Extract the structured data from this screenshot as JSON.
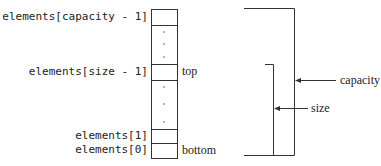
{
  "diagram": {
    "index_labels": {
      "capacity_minus_1": "elements[capacity - 1]",
      "size_minus_1": "elements[size - 1]",
      "one": "elements[1]",
      "zero": "elements[0]"
    },
    "cell_labels": {
      "top": "top",
      "bottom": "bottom"
    },
    "brackets": {
      "capacity": "capacity",
      "size": "size"
    },
    "ellipsis": "⋮",
    "colors": {
      "line": "#333333",
      "text": "#222222"
    }
  }
}
